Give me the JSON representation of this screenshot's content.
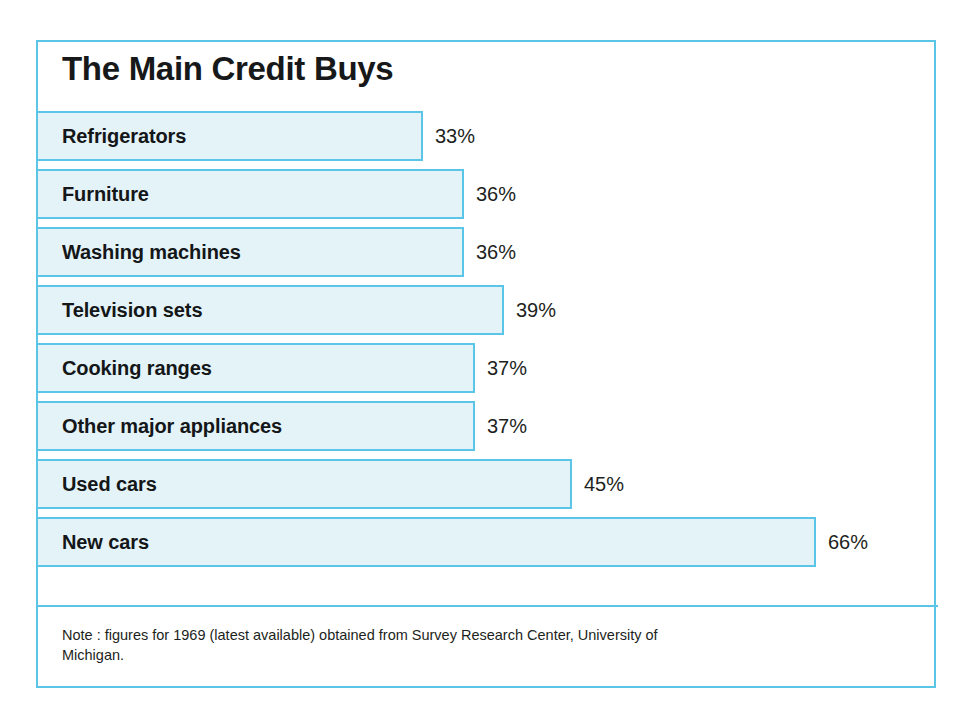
{
  "chart_data": {
    "type": "bar",
    "orientation": "horizontal",
    "title": "The Main Credit Buys",
    "xlabel": "",
    "ylabel": "",
    "xlim": [
      0,
      75
    ],
    "grid": false,
    "legend": null,
    "value_suffix": "%",
    "categories": [
      "Refrigerators",
      "Furniture",
      "Washing machines",
      "Television sets",
      "Cooking ranges",
      "Other major appliances",
      "Used cars",
      "New cars"
    ],
    "values": [
      33,
      36,
      36,
      39,
      37,
      37,
      45,
      66
    ],
    "value_labels": [
      "33%",
      "36%",
      "36%",
      "39%",
      "37%",
      "37%",
      "45%",
      "66%"
    ],
    "bars": [
      {
        "label": "Refrigerators",
        "value": 33,
        "value_label": "33%",
        "bar_width_px": 385
      },
      {
        "label": "Furniture",
        "value": 36,
        "value_label": "36%",
        "bar_width_px": 426
      },
      {
        "label": "Washing machines",
        "value": 36,
        "value_label": "36%",
        "bar_width_px": 426
      },
      {
        "label": "Television sets",
        "value": 39,
        "value_label": "39%",
        "bar_width_px": 466
      },
      {
        "label": "Cooking ranges",
        "value": 37,
        "value_label": "37%",
        "bar_width_px": 437
      },
      {
        "label": "Other major appliances",
        "value": 37,
        "value_label": "37%",
        "bar_width_px": 437
      },
      {
        "label": "Used cars",
        "value": 45,
        "value_label": "45%",
        "bar_width_px": 534
      },
      {
        "label": "New cars",
        "value": 66,
        "value_label": "66%",
        "bar_width_px": 778
      }
    ],
    "note": "Note : figures for 1969 (latest available) obtained from Survey Research Center, University of Michigan.",
    "colors": {
      "bar_fill": "#e3f3f8",
      "bar_border": "#5bc5e8",
      "frame_border": "#5bc5e8",
      "title_text": "#16181a",
      "label_text": "#141618",
      "value_text": "#1d1f21",
      "background": "#ffffff"
    }
  }
}
